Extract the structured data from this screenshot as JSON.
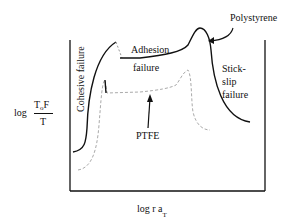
{
  "diagram": {
    "y_axis_label": {
      "prefix": "log",
      "numerator_main": "T",
      "numerator_sub": "o",
      "numerator_tail": "F",
      "denominator": "T"
    },
    "x_axis_label": {
      "main": "log r a",
      "sub": "T"
    },
    "regions": {
      "cohesive": "Cohesive failure",
      "adhesion_line1": "Adhesion",
      "adhesion_line2": "failure",
      "stick_slip_line1": "Stick-",
      "stick_slip_line2": "slip",
      "stick_slip_line3": "failure"
    },
    "curves": {
      "polystyrene": {
        "label": "Polystyrene",
        "style": "solid",
        "color": "#111111"
      },
      "ptfe": {
        "label": "PTFE",
        "style": "dashed",
        "color": "#aaaaaa"
      }
    }
  }
}
